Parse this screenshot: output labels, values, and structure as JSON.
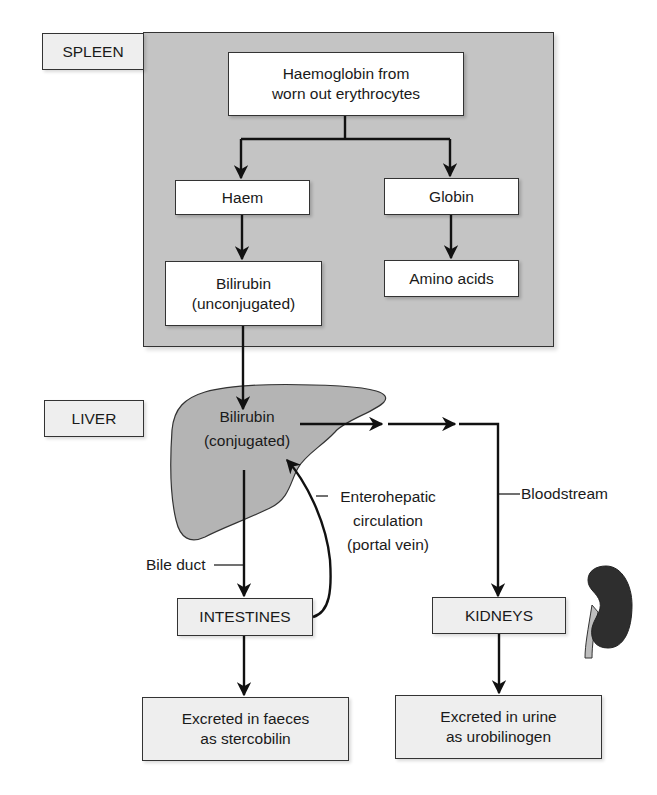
{
  "diagram": {
    "sections": {
      "spleen": "SPLEEN",
      "liver": "LIVER"
    },
    "nodes": {
      "haemoglobin": [
        "Haemoglobin from",
        "worn out erythrocytes"
      ],
      "haem": "Haem",
      "globin": "Globin",
      "bilirubin_unconjugated": [
        "Bilirubin",
        "(unconjugated)"
      ],
      "amino_acids": "Amino acids",
      "bilirubin_conjugated": [
        "Bilirubin",
        "(conjugated)"
      ],
      "intestines": "INTESTINES",
      "kidneys": "KIDNEYS",
      "faeces": [
        "Excreted in faeces",
        "as stercobilin"
      ],
      "urine": [
        "Excreted in urine",
        "as urobilinogen"
      ]
    },
    "annotations": {
      "enterohepatic": [
        "Enterohepatic",
        "circulation",
        "(portal vein)"
      ],
      "bloodstream": "Bloodstream",
      "bile_duct": "Bile duct"
    },
    "edges": [
      {
        "from": "haemoglobin",
        "to": "haem"
      },
      {
        "from": "haemoglobin",
        "to": "globin"
      },
      {
        "from": "haem",
        "to": "bilirubin_unconjugated"
      },
      {
        "from": "globin",
        "to": "amino_acids"
      },
      {
        "from": "bilirubin_unconjugated",
        "to": "bilirubin_conjugated"
      },
      {
        "from": "bilirubin_conjugated",
        "to": "intestines",
        "label": "Bile duct"
      },
      {
        "from": "intestines",
        "to": "bilirubin_conjugated",
        "label": "Enterohepatic circulation (portal vein)"
      },
      {
        "from": "bilirubin_conjugated",
        "to": "kidneys",
        "label": "Bloodstream"
      },
      {
        "from": "intestines",
        "to": "faeces"
      },
      {
        "from": "kidneys",
        "to": "urine"
      }
    ],
    "icons": {
      "liver": "liver-organ-icon",
      "kidney": "kidney-organ-icon"
    },
    "colors": {
      "panel_gray": "#c4c4c4",
      "liver_gray": "#b4b4b4",
      "kidney_dark": "#2e2e2e",
      "label_box": "#eeeeee",
      "line": "#111111"
    }
  }
}
